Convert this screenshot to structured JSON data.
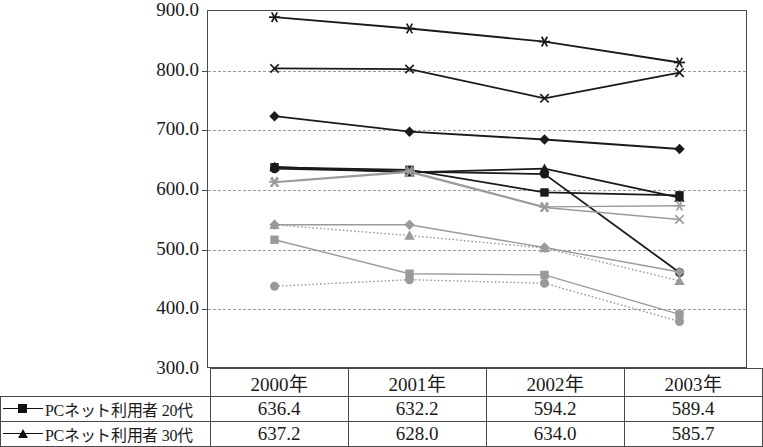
{
  "chart_data": {
    "type": "line",
    "title": "",
    "subtitle": "",
    "xlabel": "",
    "ylabel": "",
    "categories": [
      "2000年",
      "2001年",
      "2002年",
      "2003年"
    ],
    "ylim": [
      300.0,
      900.0
    ],
    "ytick_step": 100.0,
    "ytick_labels": [
      "900.0",
      "800.0",
      "700.0",
      "600.0",
      "500.0",
      "400.0",
      "300.0"
    ],
    "ytick_values": [
      900.0,
      800.0,
      700.0,
      600.0,
      500.0,
      400.0,
      300.0
    ],
    "grid": "horizontal-dashed",
    "legend_position": "table-below",
    "series": [
      {
        "name": "series-asterisk-black",
        "marker": "asterisk",
        "color": "#1a1a1a",
        "line": "solid",
        "values": [
          888.0,
          869.0,
          847.0,
          812.0
        ]
      },
      {
        "name": "series-x-black",
        "marker": "x",
        "color": "#1a1a1a",
        "line": "solid",
        "values": [
          802.0,
          801.0,
          752.0,
          795.0
        ]
      },
      {
        "name": "series-diamond-black",
        "marker": "diamond",
        "color": "#1a1a1a",
        "line": "solid",
        "values": [
          722.0,
          696.0,
          683.0,
          667.0
        ]
      },
      {
        "name": "PCネット利用者 30代",
        "marker": "triangle",
        "color": "#1a1a1a",
        "line": "solid",
        "values": [
          637.2,
          628.0,
          634.0,
          585.7
        ]
      },
      {
        "name": "PCネット利用者 20代",
        "marker": "square",
        "color": "#1a1a1a",
        "line": "solid",
        "values": [
          636.4,
          632.2,
          594.2,
          589.4
        ]
      },
      {
        "name": "series-circle-black",
        "marker": "circle",
        "color": "#1a1a1a",
        "line": "solid",
        "values": [
          634.0,
          629.0,
          625.0,
          460.0
        ]
      },
      {
        "name": "series-x-gray",
        "marker": "x",
        "color": "#9a9a9a",
        "line": "solid",
        "values": [
          611.0,
          628.0,
          569.0,
          549.0
        ]
      },
      {
        "name": "series-asterisk-gray",
        "marker": "asterisk",
        "color": "#9a9a9a",
        "line": "solid",
        "values": [
          612.0,
          630.0,
          570.0,
          572.0
        ]
      },
      {
        "name": "series-diamond-gray",
        "marker": "diamond",
        "color": "#9a9a9a",
        "line": "solid",
        "values": [
          540.0,
          540.0,
          502.0,
          461.0
        ]
      },
      {
        "name": "series-triangle-gray",
        "marker": "triangle",
        "color": "#9a9a9a",
        "line": "dotted",
        "values": [
          540.0,
          522.0,
          501.0,
          446.0
        ]
      },
      {
        "name": "series-square-gray",
        "marker": "square",
        "color": "#9a9a9a",
        "line": "solid",
        "values": [
          515.0,
          458.0,
          456.0,
          390.0
        ]
      },
      {
        "name": "series-circle-gray",
        "marker": "circle",
        "color": "#9a9a9a",
        "line": "dotted",
        "values": [
          437.0,
          448.0,
          442.0,
          378.0
        ]
      }
    ]
  },
  "table": {
    "corner_label": "",
    "year_headers": [
      "2000年",
      "2001年",
      "2002年",
      "2003年"
    ],
    "rows": [
      {
        "marker": "square",
        "label": "PCネット利用者 20代",
        "values": [
          "636.4",
          "632.2",
          "594.2",
          "589.4"
        ]
      },
      {
        "marker": "triangle",
        "label": "PCネット利用者 30代",
        "values": [
          "637.2",
          "628.0",
          "634.0",
          "585.7"
        ]
      }
    ]
  },
  "colors": {
    "axis": "#4a4a4a",
    "grid": "#9a9a9a",
    "series_dark": "#1a1a1a",
    "series_light": "#9a9a9a",
    "background": "#ffffff"
  }
}
